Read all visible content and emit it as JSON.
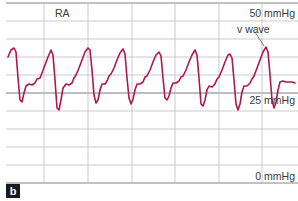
{
  "panel_label": "b",
  "chamber_label": "RA",
  "scale_labels": {
    "top": "50 mmHg",
    "mid": "25 mmHg",
    "bottom": "0 mmHg"
  },
  "annotation": "v wave",
  "colors": {
    "trace": "#b0174a",
    "grid": "#b5b5b5",
    "axis": "#555555"
  },
  "chart_data": {
    "type": "line",
    "title": "RA",
    "xlabel": "",
    "ylabel": "mmHg",
    "ylim": [
      0,
      50
    ],
    "ytick_labels": [
      "0 mmHg",
      "25 mmHg",
      "50 mmHg"
    ],
    "grid": true,
    "annotations": [
      {
        "text": "v wave",
        "target": "last v-wave peak"
      }
    ],
    "series": [
      {
        "name": "RA pressure",
        "points_px": [
          [
            8,
            57
          ],
          [
            11,
            50
          ],
          [
            14,
            48
          ],
          [
            16,
            52
          ],
          [
            18,
            78
          ],
          [
            20,
            100
          ],
          [
            22,
            102
          ],
          [
            24,
            93
          ],
          [
            26,
            86
          ],
          [
            29,
            84
          ],
          [
            32,
            85
          ],
          [
            35,
            83
          ],
          [
            37,
            79
          ],
          [
            40,
            78
          ],
          [
            42,
            73
          ],
          [
            45,
            65
          ],
          [
            48,
            57
          ],
          [
            51,
            50
          ],
          [
            53,
            55
          ],
          [
            55,
            80
          ],
          [
            57,
            108
          ],
          [
            59,
            110
          ],
          [
            61,
            100
          ],
          [
            63,
            88
          ],
          [
            66,
            84
          ],
          [
            69,
            85
          ],
          [
            72,
            83
          ],
          [
            74,
            78
          ],
          [
            76,
            75
          ],
          [
            79,
            68
          ],
          [
            82,
            60
          ],
          [
            85,
            52
          ],
          [
            88,
            48
          ],
          [
            90,
            50
          ],
          [
            92,
            70
          ],
          [
            94,
            95
          ],
          [
            96,
            103
          ],
          [
            98,
            100
          ],
          [
            100,
            90
          ],
          [
            102,
            84
          ],
          [
            105,
            84
          ],
          [
            107,
            81
          ],
          [
            109,
            76
          ],
          [
            111,
            74
          ],
          [
            114,
            68
          ],
          [
            117,
            60
          ],
          [
            120,
            53
          ],
          [
            123,
            49
          ],
          [
            125,
            54
          ],
          [
            127,
            78
          ],
          [
            129,
            98
          ],
          [
            131,
            104
          ],
          [
            133,
            99
          ],
          [
            135,
            90
          ],
          [
            137,
            84
          ],
          [
            140,
            84
          ],
          [
            143,
            82
          ],
          [
            145,
            77
          ],
          [
            147,
            76
          ],
          [
            150,
            70
          ],
          [
            153,
            62
          ],
          [
            156,
            55
          ],
          [
            159,
            52
          ],
          [
            161,
            56
          ],
          [
            163,
            78
          ],
          [
            165,
            98
          ],
          [
            167,
            100
          ],
          [
            169,
            96
          ],
          [
            171,
            88
          ],
          [
            173,
            83
          ],
          [
            176,
            83
          ],
          [
            179,
            81
          ],
          [
            181,
            77
          ],
          [
            183,
            76
          ],
          [
            186,
            70
          ],
          [
            189,
            62
          ],
          [
            192,
            55
          ],
          [
            195,
            50
          ],
          [
            197,
            55
          ],
          [
            199,
            78
          ],
          [
            201,
            104
          ],
          [
            203,
            106
          ],
          [
            205,
            100
          ],
          [
            207,
            90
          ],
          [
            209,
            86
          ],
          [
            212,
            87
          ],
          [
            215,
            84
          ],
          [
            217,
            79
          ],
          [
            219,
            77
          ],
          [
            222,
            70
          ],
          [
            225,
            62
          ],
          [
            228,
            55
          ],
          [
            230,
            54
          ],
          [
            232,
            58
          ],
          [
            234,
            80
          ],
          [
            236,
            104
          ],
          [
            238,
            110
          ],
          [
            240,
            104
          ],
          [
            242,
            92
          ],
          [
            244,
            86
          ],
          [
            247,
            86
          ],
          [
            250,
            83
          ],
          [
            252,
            79
          ],
          [
            254,
            76
          ],
          [
            257,
            68
          ],
          [
            260,
            60
          ],
          [
            263,
            52
          ],
          [
            266,
            47
          ],
          [
            268,
            52
          ],
          [
            270,
            75
          ],
          [
            272,
            100
          ],
          [
            274,
            108
          ],
          [
            276,
            102
          ],
          [
            278,
            90
          ],
          [
            280,
            82
          ],
          [
            283,
            81
          ],
          [
            286,
            82
          ],
          [
            289,
            82
          ],
          [
            292,
            82
          ],
          [
            295,
            83
          ]
        ]
      }
    ],
    "pixel_scale": {
      "y_50mmHg": 3,
      "y_25mmHg": 93,
      "y_0mmHg": 183
    }
  }
}
